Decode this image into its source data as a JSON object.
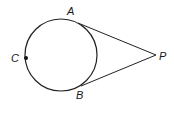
{
  "diagram": {
    "type": "circle-with-tangents",
    "colors": {
      "stroke": "#222222",
      "background": "#ffffff"
    },
    "circle": {
      "cx": 61,
      "cy": 55,
      "r": 36
    },
    "points": {
      "A": {
        "label": "A",
        "x": 78,
        "y": 23,
        "label_x": 67,
        "label_y": 15
      },
      "B": {
        "label": "B",
        "x": 81,
        "y": 86,
        "label_x": 76,
        "label_y": 99
      },
      "C": {
        "label": "C",
        "x": 26,
        "y": 58,
        "label_x": 11,
        "label_y": 62
      },
      "P": {
        "label": "P",
        "x": 156,
        "y": 55,
        "label_x": 159,
        "label_y": 60
      }
    },
    "segments": [
      {
        "name": "tangent-PA",
        "from": "P",
        "to": "A"
      },
      {
        "name": "tangent-PB",
        "from": "P",
        "to": "B"
      }
    ]
  }
}
